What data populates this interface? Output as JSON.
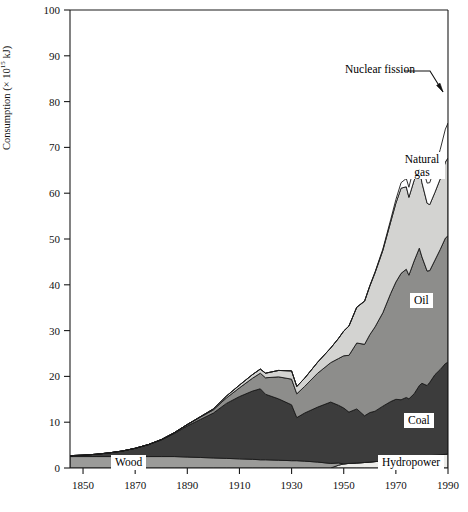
{
  "figure": {
    "ylabel_prefix": "Consumption (× 10",
    "ylabel_exponent": "15",
    "ylabel_suffix": " kJ)"
  },
  "labels": {
    "wood": "Wood",
    "coal": "Coal",
    "oil": "Oil",
    "natural_gas_line1": "Natural",
    "natural_gas_line2": "gas",
    "hydropower": "Hydropower",
    "nuclear": "Nuclear fission"
  },
  "colors": {
    "hydropower": "#ededea",
    "wood": "#9b9b99",
    "coal": "#3c3c3c",
    "oil": "#8d8d8b",
    "natural_gas": "#d3d3d1",
    "nuclear": "#fefefe",
    "outline": "#1a1a1a",
    "axis": "#1a1a1a",
    "background": "#ffffff"
  },
  "chart_data": {
    "type": "area",
    "title": "",
    "xlabel": "",
    "ylabel": "Consumption (× 10^15 kJ)",
    "xlim": [
      1845,
      1990
    ],
    "ylim": [
      0,
      100
    ],
    "xticks": [
      1850,
      1870,
      1890,
      1910,
      1930,
      1950,
      1970,
      1990
    ],
    "yticks": [
      0,
      10,
      20,
      30,
      40,
      50,
      60,
      70,
      80,
      90,
      100
    ],
    "grid": false,
    "legend": "inline band labels",
    "stacked": true,
    "stack_order_bottom_to_top": [
      "Hydropower",
      "Wood",
      "Coal",
      "Oil",
      "Natural gas",
      "Nuclear fission"
    ],
    "x": [
      1845,
      1850,
      1855,
      1860,
      1865,
      1870,
      1875,
      1880,
      1885,
      1890,
      1895,
      1900,
      1905,
      1910,
      1915,
      1918,
      1920,
      1925,
      1930,
      1932,
      1935,
      1940,
      1945,
      1948,
      1950,
      1952,
      1955,
      1958,
      1960,
      1962,
      1965,
      1968,
      1970,
      1972,
      1974,
      1975,
      1977,
      1979,
      1980,
      1982,
      1983,
      1985,
      1987,
      1989,
      1990
    ],
    "series": [
      {
        "name": "Hydropower",
        "values": [
          0,
          0,
          0,
          0,
          0,
          0,
          0,
          0,
          0,
          0,
          0,
          0,
          0,
          0,
          0,
          0,
          0,
          0,
          0,
          0,
          0,
          0,
          0,
          0.6,
          0.9,
          1.0,
          1.1,
          1.2,
          1.3,
          1.4,
          1.5,
          1.7,
          1.8,
          1.9,
          2.0,
          2.1,
          2.2,
          2.4,
          2.5,
          2.6,
          2.7,
          2.8,
          2.9,
          3.0,
          3.1
        ]
      },
      {
        "name": "Wood",
        "values": [
          2.5,
          2.5,
          2.5,
          2.5,
          2.5,
          2.5,
          2.5,
          2.5,
          2.5,
          2.4,
          2.3,
          2.2,
          2.1,
          2.0,
          1.9,
          1.8,
          1.8,
          1.7,
          1.6,
          1.6,
          1.5,
          1.3,
          1.0,
          0.5,
          0,
          0,
          0,
          0,
          0,
          0,
          0,
          0,
          0,
          0,
          0,
          0,
          0,
          0,
          0,
          0,
          0,
          0,
          0,
          0,
          0
        ]
      },
      {
        "name": "Coal",
        "values": [
          0.2,
          0.3,
          0.5,
          0.8,
          1.2,
          1.8,
          2.6,
          3.6,
          5.0,
          6.8,
          8.3,
          9.8,
          12.0,
          13.6,
          14.9,
          15.5,
          14.3,
          13.4,
          12.2,
          9.4,
          10.5,
          12.0,
          13.4,
          12.6,
          12.2,
          11.2,
          11.8,
          10.2,
          10.8,
          11.0,
          12.0,
          12.8,
          13.2,
          13.0,
          13.4,
          13.0,
          14.0,
          15.6,
          16.0,
          15.4,
          16.0,
          17.6,
          18.6,
          19.8,
          20.0
        ]
      },
      {
        "name": "Oil",
        "values": [
          0,
          0,
          0,
          0,
          0,
          0,
          0,
          0.1,
          0.2,
          0.3,
          0.5,
          0.7,
          1.2,
          1.9,
          2.8,
          3.4,
          3.6,
          4.8,
          5.6,
          5.2,
          5.8,
          7.4,
          8.6,
          10.2,
          11.4,
          12.4,
          14.4,
          15.6,
          17.0,
          18.4,
          20.4,
          23.6,
          25.6,
          27.6,
          28.0,
          27.0,
          29.0,
          30.0,
          27.6,
          25.0,
          24.4,
          25.0,
          26.2,
          27.4,
          27.6
        ]
      },
      {
        "name": "Natural gas",
        "values": [
          0,
          0,
          0,
          0,
          0,
          0,
          0,
          0,
          0,
          0,
          0.1,
          0.2,
          0.4,
          0.6,
          0.8,
          0.9,
          1.0,
          1.4,
          1.8,
          1.6,
          1.8,
          2.4,
          3.2,
          4.4,
          5.4,
          6.4,
          7.8,
          9.4,
          10.6,
          11.8,
          13.6,
          15.6,
          17.2,
          18.6,
          18.0,
          17.0,
          17.6,
          17.4,
          16.2,
          14.8,
          14.4,
          14.8,
          15.4,
          16.6,
          17.0
        ]
      },
      {
        "name": "Nuclear fission",
        "values": [
          0,
          0,
          0,
          0,
          0,
          0,
          0,
          0,
          0,
          0,
          0,
          0,
          0,
          0,
          0,
          0,
          0,
          0,
          0,
          0,
          0,
          0,
          0,
          0,
          0,
          0,
          0,
          0.1,
          0.1,
          0.2,
          0.3,
          0.5,
          0.8,
          1.2,
          1.8,
          2.2,
          3.0,
          3.6,
          3.8,
          4.4,
          4.8,
          5.6,
          6.4,
          7.2,
          7.6
        ]
      }
    ],
    "annotations": [
      {
        "text": "Nuclear fission",
        "type": "callout-with-arrow",
        "points_to_year": 1986
      },
      {
        "text": "Natural gas",
        "type": "band-label"
      },
      {
        "text": "Oil",
        "type": "band-label"
      },
      {
        "text": "Coal",
        "type": "band-label"
      },
      {
        "text": "Wood",
        "type": "band-label"
      },
      {
        "text": "Hydropower",
        "type": "band-label"
      }
    ]
  }
}
